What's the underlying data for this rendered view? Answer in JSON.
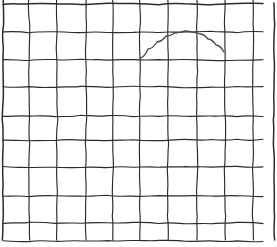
{
  "figure": {
    "background_color": "#ffffff",
    "width": 277,
    "height": 247
  },
  "chart_data": {
    "type": "line",
    "subtitle": "",
    "xlabel": "",
    "ylabel": "",
    "grid": true,
    "legend_position": "none",
    "xlim": [
      3,
      274
    ],
    "ylim": [
      3,
      247
    ],
    "grid_style": {
      "line_color": "#2b2b2b",
      "line_width": 1.15,
      "border_color": "#2b2b2b",
      "border_width": 1.5,
      "hand_drawn": true
    },
    "vertical_gridlines_x": [
      3,
      29,
      57,
      86,
      113,
      140,
      168,
      197,
      225,
      253,
      274
    ],
    "horizontal_gridlines_y": [
      4,
      32,
      60,
      87,
      116,
      140,
      167,
      196,
      223,
      241
    ],
    "columns": 10,
    "rows": 9,
    "series": [
      {
        "name": "arc",
        "color": "#4a4a4a",
        "line_width": 1.35,
        "x": [
          140,
          148,
          157,
          166,
          175,
          184,
          192,
          200,
          208,
          216,
          224
        ],
        "y": [
          58,
          49,
          42,
          36,
          33,
          31,
          32,
          34,
          39,
          45,
          52
        ],
        "peak": [
          184,
          31
        ],
        "start_point": [
          140,
          58
        ],
        "end_point": [
          224,
          52
        ]
      }
    ]
  }
}
